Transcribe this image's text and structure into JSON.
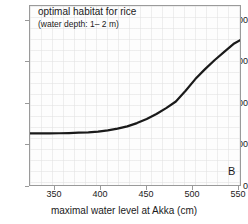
{
  "chart_data": {
    "type": "line",
    "title": "",
    "panel_label": "B",
    "annotation": {
      "line1": "optimal habitat for rice",
      "line2": "(water depth: 1– 2 m)"
    },
    "xlabel": "maximal water level at Akka (cm)",
    "ylabel": "",
    "xlim": [
      330,
      548
    ],
    "ylim": [
      0,
      4300
    ],
    "grid": true,
    "legend_position": "none",
    "xticks": [
      350,
      400,
      450,
      500,
      550
    ],
    "xtick_labels": [
      "350",
      "400",
      "450",
      "500",
      "550"
    ],
    "yticks": [
      0,
      1000,
      2000,
      3000,
      4000
    ],
    "ytick_labels": [
      "0",
      "1000",
      "2000",
      "3000",
      "4000"
    ],
    "series": [
      {
        "name": "optimal habitat for rice",
        "color": "#1a1a1a",
        "x": [
          330,
          340,
          350,
          360,
          370,
          380,
          390,
          400,
          410,
          420,
          430,
          440,
          450,
          460,
          470,
          480,
          490,
          500,
          510,
          520,
          530,
          540,
          548
        ],
        "values": [
          1290,
          1290,
          1292,
          1295,
          1300,
          1308,
          1318,
          1335,
          1365,
          1405,
          1460,
          1540,
          1640,
          1760,
          1900,
          2060,
          2320,
          2600,
          2840,
          3060,
          3260,
          3460,
          3560
        ]
      }
    ]
  }
}
